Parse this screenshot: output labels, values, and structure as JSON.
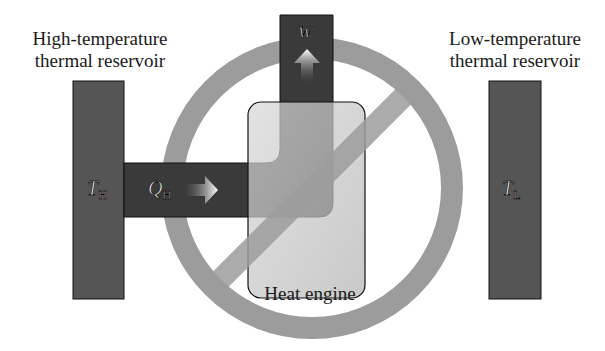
{
  "labels": {
    "hot_reservoir": "High-temperature thermal reservoir",
    "hot_reservoir_line1": "High-temperature",
    "hot_reservoir_line2": "thermal reservoir",
    "cold_reservoir_line1": "Low-temperature",
    "cold_reservoir_line2": "thermal reservoir",
    "engine": "Heat engine"
  },
  "symbols": {
    "hot_temp": "T",
    "hot_temp_sub": "H",
    "cold_temp": "T",
    "cold_temp_sub": "L",
    "heat_in": "Q",
    "heat_in_sub": "H",
    "work_out": "W"
  },
  "icons": {
    "prohibition": "no-symbol-icon",
    "heat_arrow": "arrow-right-icon",
    "work_arrow": "arrow-up-icon"
  },
  "colors": {
    "reservoir_fill": "#555555",
    "pipe_fill": "#3c3c3c",
    "engine_fill": "#c4c4c4",
    "prohibition_ring": "#9a9a9a",
    "text": "#1a1a1a"
  }
}
